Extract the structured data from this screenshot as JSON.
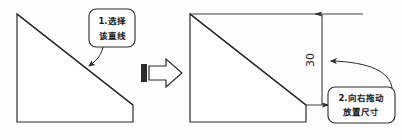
{
  "figure": {
    "background_color": "#fdfdfd",
    "line_color": "#2b2b2b",
    "text_color": "#1a1a1a"
  },
  "left_panel": {
    "shape_name": "斜边四边形",
    "description": "待标注的图形"
  },
  "right_panel": {
    "shape_name": "斜边四边形",
    "description": "已标注尺寸的图形"
  },
  "transition": {
    "icon": "block-right-arrow-icon",
    "label": "下一步"
  },
  "callouts": [
    {
      "id": "callout-1",
      "line1": "1.选择",
      "line2": "该直线",
      "target": "斜直线"
    },
    {
      "id": "callout-2",
      "line1": "2.向右拖动",
      "line2": "放置尺寸",
      "target": "尺寸线"
    }
  ],
  "dimension": {
    "name": "vertical-dimension",
    "value": "30",
    "orientation": "vertical",
    "arrow_style": "double-filled"
  }
}
